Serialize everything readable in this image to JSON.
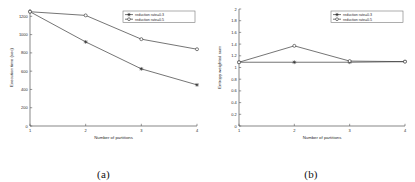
{
  "figure": {
    "panels": [
      {
        "caption": "(a)"
      },
      {
        "caption": "(b)"
      }
    ]
  },
  "chart_data": [
    {
      "type": "line",
      "title": "",
      "xlabel": "Number of partitions",
      "ylabel": "Execution time (sec)",
      "x": [
        1,
        2,
        3,
        4
      ],
      "xticklabels": [
        "1",
        "2",
        "3",
        "4"
      ],
      "yticklabels": [
        "0",
        "200",
        "400",
        "600",
        "800",
        "1000",
        "1200"
      ],
      "yticks": [
        0,
        200,
        400,
        600,
        800,
        1000,
        1200
      ],
      "xlim": [
        1,
        4
      ],
      "ylim": [
        0,
        1280
      ],
      "grid": false,
      "legend_position": "upper-right",
      "series": [
        {
          "name": "reduction rate=0.3",
          "marker": "star",
          "values": [
            1250,
            920,
            625,
            450
          ]
        },
        {
          "name": "reduction rate=0.5",
          "marker": "circle",
          "values": [
            1250,
            1210,
            950,
            840
          ]
        }
      ]
    },
    {
      "type": "line",
      "title": "",
      "xlabel": "Number of partitions",
      "ylabel": "Entropy weighted sum",
      "x": [
        1,
        2,
        3,
        4
      ],
      "xticklabels": [
        "1",
        "2",
        "3",
        "4"
      ],
      "yticklabels": [
        "0",
        "0.2",
        "0.4",
        "0.6",
        "0.8",
        "1",
        "1.2",
        "1.4",
        "1.6",
        "1.8",
        "2"
      ],
      "yticks": [
        0,
        0.2,
        0.4,
        0.6,
        0.8,
        1,
        1.2,
        1.4,
        1.6,
        1.8,
        2
      ],
      "xlim": [
        1,
        4
      ],
      "ylim": [
        0,
        2
      ],
      "grid": false,
      "legend_position": "upper-right",
      "series": [
        {
          "name": "reduction rate=0.3",
          "marker": "star",
          "values": [
            1.09,
            1.09,
            1.09,
            1.1
          ]
        },
        {
          "name": "reduction rate=0.5",
          "marker": "circle",
          "values": [
            1.09,
            1.37,
            1.11,
            1.1
          ]
        }
      ]
    }
  ]
}
